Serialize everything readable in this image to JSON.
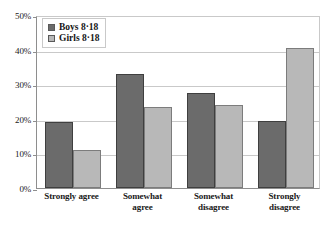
{
  "chart_data": {
    "type": "bar",
    "title": "",
    "subtitle": "",
    "xlabel": "",
    "ylabel": "",
    "categories": [
      "Strongly agree",
      "Somewhat agree",
      "Somewhat disagree",
      "Strongly disagree"
    ],
    "category_lines": [
      [
        "Strongly agree"
      ],
      [
        "Somewhat",
        "agree"
      ],
      [
        "Somewhat",
        "disagree"
      ],
      [
        "Strongly",
        "disagree"
      ]
    ],
    "series": [
      {
        "name": "Boys 8·18",
        "key": "boys",
        "color": "#6b6b6b",
        "values": [
          19,
          33,
          27.5,
          19.5
        ]
      },
      {
        "name": "Girls 8·18",
        "key": "girls",
        "color": "#b8b8b8",
        "values": [
          11,
          23.5,
          24,
          40.5
        ]
      }
    ],
    "ylim": [
      0,
      50
    ],
    "ytick_values": [
      0,
      10,
      20,
      30,
      40,
      50
    ],
    "ytick_labels": [
      "0%",
      "10%",
      "20%",
      "30%",
      "40%",
      "50%"
    ],
    "grid": true,
    "legend_position": "upper-left",
    "value_suffix": "%"
  },
  "legend": {
    "items": [
      {
        "label": "Boys 8·18"
      },
      {
        "label": "Girls 8·18"
      }
    ]
  }
}
